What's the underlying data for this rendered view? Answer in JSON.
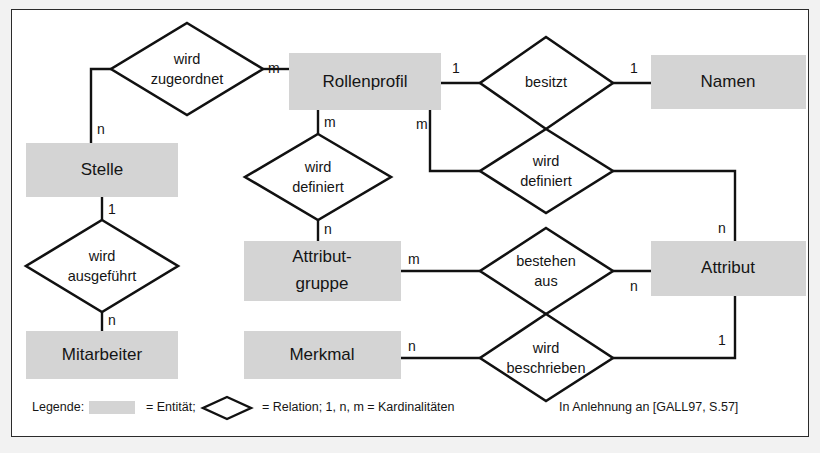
{
  "figure": {
    "background_color": "#f2f2f2",
    "frame_color": "#2b2b2b",
    "entity_fill": "#d4d4d4",
    "relation_fill": "#ffffff",
    "line_color": "#111111"
  },
  "entities": [
    {
      "id": "stelle",
      "label": "Stelle",
      "x": 25,
      "y": 142,
      "w": 152,
      "h": 54
    },
    {
      "id": "mitarbeiter",
      "label": "Mitarbeiter",
      "x": 25,
      "y": 330,
      "w": 152,
      "h": 48
    },
    {
      "id": "rollenprofil",
      "label": "Rollenprofil",
      "x": 288,
      "y": 52,
      "w": 152,
      "h": 57
    },
    {
      "id": "attributgruppe",
      "label": "Attribut-",
      "label2": "gruppe",
      "x": 243,
      "y": 240,
      "w": 157,
      "h": 60
    },
    {
      "id": "merkmal",
      "label": "Merkmal",
      "x": 243,
      "y": 330,
      "w": 157,
      "h": 48
    },
    {
      "id": "namen",
      "label": "Namen",
      "x": 650,
      "y": 54,
      "w": 155,
      "h": 54
    },
    {
      "id": "attribut",
      "label": "Attribut",
      "x": 650,
      "y": 240,
      "w": 155,
      "h": 55
    }
  ],
  "relations": [
    {
      "id": "wird-zugeordnet",
      "line1": "wird",
      "line2": "zugeordnet",
      "cx": 186,
      "cy": 68,
      "rx": 76,
      "ry": 46
    },
    {
      "id": "wird-ausgefuehrt",
      "line1": "wird",
      "line2": "ausgeführt",
      "cx": 100,
      "cy": 265,
      "rx": 76,
      "ry": 46
    },
    {
      "id": "wird-definiert-l",
      "line1": "wird",
      "line2": "definiert",
      "cx": 316,
      "cy": 176,
      "rx": 73,
      "ry": 43
    },
    {
      "id": "besitzt",
      "line1": "besitzt",
      "line2": "",
      "cx": 540,
      "cy": 82,
      "rx": 72,
      "ry": 46
    },
    {
      "id": "wird-definiert-r",
      "line1": "wird",
      "line2": "definiert",
      "cx": 540,
      "cy": 170,
      "rx": 72,
      "ry": 42
    },
    {
      "id": "bestehen-aus",
      "line1": "bestehen",
      "line2": "aus",
      "cx": 540,
      "cy": 270,
      "rx": 72,
      "ry": 43
    },
    {
      "id": "wird-beschrieben",
      "line1": "wird",
      "line2": "beschrieben",
      "cx": 540,
      "cy": 357,
      "rx": 72,
      "ry": 42
    }
  ],
  "cardinalities": [
    {
      "id": "card-stelle-zugeordnet",
      "value": "n",
      "x": 105,
      "y": 128
    },
    {
      "id": "card-zugeordnet-rollenprofil",
      "value": "m",
      "x": 268,
      "y": 68
    },
    {
      "id": "card-stelle-ausgefuehrt",
      "value": "1",
      "x": 105,
      "y": 211
    },
    {
      "id": "card-ausgefuehrt-mitarbeiter",
      "value": "n",
      "x": 105,
      "y": 317
    },
    {
      "id": "card-rollenprofil-definiert",
      "value": "m",
      "x": 322,
      "y": 122
    },
    {
      "id": "card-definiert-attributgruppe",
      "value": "n",
      "x": 322,
      "y": 228
    },
    {
      "id": "card-rollenprofil-besitzt",
      "value": "1",
      "x": 452,
      "y": 68
    },
    {
      "id": "card-besitzt-namen",
      "value": "1",
      "x": 628,
      "y": 68
    },
    {
      "id": "card-rollenprofil-definiert-r",
      "value": "m",
      "x": 418,
      "y": 124
    },
    {
      "id": "card-definiert-r-attribut",
      "value": "n",
      "x": 712,
      "y": 228
    },
    {
      "id": "card-attributgruppe-bestehen",
      "value": "m",
      "x": 410,
      "y": 258
    },
    {
      "id": "card-bestehen-attribut",
      "value": "n",
      "x": 628,
      "y": 285
    },
    {
      "id": "card-merkmal-beschrieben",
      "value": "n",
      "x": 410,
      "y": 345
    },
    {
      "id": "card-beschrieben-attribut",
      "value": "1",
      "x": 712,
      "y": 340
    }
  ],
  "legend": {
    "prefix": "Legende:",
    "entity_eq": "= Entität;",
    "relation_eq": "= Relation; 1, n, m = Kardinalitäten"
  },
  "credit": {
    "text": "In Anlehnung an [GALL97, S.57]"
  }
}
